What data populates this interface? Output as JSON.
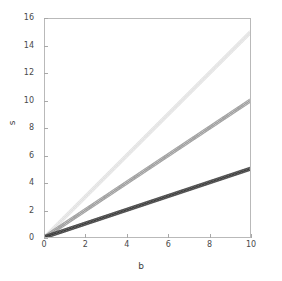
{
  "chart_data": {
    "type": "scatter",
    "title": "",
    "xlabel": "b",
    "ylabel": "s",
    "xlim": [
      0,
      10
    ],
    "ylim": [
      0,
      16
    ],
    "xticks": [
      0,
      2,
      4,
      6,
      8,
      10
    ],
    "yticks": [
      0,
      2,
      4,
      6,
      8,
      10,
      12,
      14,
      16
    ],
    "grid": false,
    "legend": "none",
    "background": "#ffffff",
    "axis_color": "#b9b9b9",
    "series": [
      {
        "name": "s = 1.5 b",
        "slope": 1.5,
        "color": "#e0e0e0",
        "marker": "circle-open",
        "x": [
          0,
          1,
          2,
          3,
          4,
          5,
          6,
          7,
          8,
          9,
          10
        ],
        "values": [
          0,
          1.5,
          3,
          4.5,
          6,
          7.5,
          9,
          10.5,
          12,
          13.5,
          15
        ]
      },
      {
        "name": "s = 1.0 b",
        "slope": 1.0,
        "color": "#9a9a9a",
        "marker": "circle-open",
        "x": [
          0,
          1,
          2,
          3,
          4,
          5,
          6,
          7,
          8,
          9,
          10
        ],
        "values": [
          0,
          1,
          2,
          3,
          4,
          5,
          6,
          7,
          8,
          9,
          10
        ]
      },
      {
        "name": "s = 0.5 b",
        "slope": 0.5,
        "color": "#3a3a3a",
        "marker": "circle-open",
        "x": [
          0,
          1,
          2,
          3,
          4,
          5,
          6,
          7,
          8,
          9,
          10
        ],
        "values": [
          0,
          0.5,
          1,
          1.5,
          2,
          2.5,
          3,
          3.5,
          4,
          4.5,
          5
        ]
      }
    ]
  },
  "axes": {
    "x_title": "b",
    "y_title": "s",
    "x_tick_labels": [
      "0",
      "2",
      "4",
      "6",
      "8",
      "10"
    ],
    "y_tick_labels": [
      "0",
      "2",
      "4",
      "6",
      "8",
      "10",
      "12",
      "14",
      "16"
    ]
  }
}
